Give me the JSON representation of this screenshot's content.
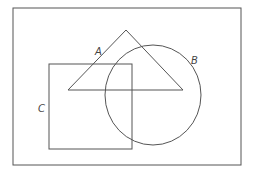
{
  "diagram": {
    "type": "venn",
    "sets": [
      {
        "label": "A",
        "shape": "triangle"
      },
      {
        "label": "B",
        "shape": "circle"
      },
      {
        "label": "C",
        "shape": "square"
      }
    ]
  }
}
